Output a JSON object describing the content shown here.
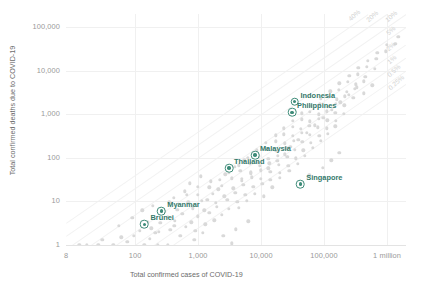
{
  "chart_data": {
    "type": "scatter",
    "title": "",
    "xlabel": "Total confirmed cases of COVID-19",
    "ylabel": "Total confirmed deaths due to COVID-19",
    "xscale": "log",
    "yscale": "log",
    "xlim": [
      8,
      2000000
    ],
    "ylim": [
      1,
      200000
    ],
    "grid": true,
    "legend": "none",
    "x_ticks": [
      {
        "value": 8,
        "label": "8"
      },
      {
        "value": 100,
        "label": "100"
      },
      {
        "value": 1000,
        "label": "1,000"
      },
      {
        "value": 10000,
        "label": "10,000"
      },
      {
        "value": 100000,
        "label": "100,000"
      },
      {
        "value": 1000000,
        "label": "1 million"
      }
    ],
    "y_ticks": [
      {
        "value": 1,
        "label": "1"
      },
      {
        "value": 10,
        "label": "10"
      },
      {
        "value": 100,
        "label": "100"
      },
      {
        "value": 1000,
        "label": "1,000"
      },
      {
        "value": 10000,
        "label": "10,000"
      },
      {
        "value": 100000,
        "label": "100,000"
      }
    ],
    "reference_lines": [
      {
        "label": "40%",
        "ratio": 0.4
      },
      {
        "label": "20%",
        "ratio": 0.2
      },
      {
        "label": "10%",
        "ratio": 0.1
      },
      {
        "label": "5%",
        "ratio": 0.05
      },
      {
        "label": "2%",
        "ratio": 0.02
      },
      {
        "label": "1%",
        "ratio": 0.01
      },
      {
        "label": "0.5%",
        "ratio": 0.005
      },
      {
        "label": "0.25%",
        "ratio": 0.0025
      }
    ],
    "highlighted": [
      {
        "name": "Indonesia",
        "cases": 34000,
        "deaths": 1950,
        "label_dx": 6,
        "label_dy": -7
      },
      {
        "name": "Philippines",
        "cases": 31000,
        "deaths": 1100,
        "label_dx": 5,
        "label_dy": -7
      },
      {
        "name": "Malaysia",
        "cases": 8000,
        "deaths": 115,
        "label_dx": 5,
        "label_dy": -7
      },
      {
        "name": "Thailand",
        "cases": 3100,
        "deaths": 58,
        "label_dx": 5,
        "label_dy": -7
      },
      {
        "name": "Singapore",
        "cases": 42000,
        "deaths": 25,
        "label_dx": 6,
        "label_dy": -7
      },
      {
        "name": "Myanmar",
        "cases": 260,
        "deaths": 6,
        "label_dx": 6,
        "label_dy": -7
      },
      {
        "name": "Brunei",
        "cases": 141,
        "deaths": 3,
        "label_dx": 6,
        "label_dy": -7
      }
    ],
    "background_points": [
      [
        13,
        1
      ],
      [
        17,
        1
      ],
      [
        26,
        1
      ],
      [
        45,
        1
      ],
      [
        140,
        1
      ],
      [
        230,
        1
      ],
      [
        330,
        1
      ],
      [
        30,
        1.3
      ],
      [
        60,
        1.5
      ],
      [
        95,
        1.6
      ],
      [
        210,
        1.9
      ],
      [
        520,
        1.6
      ],
      [
        120,
        2.1
      ],
      [
        180,
        2.4
      ],
      [
        360,
        2.2
      ],
      [
        640,
        2.6
      ],
      [
        900,
        2.1
      ],
      [
        250,
        3.2
      ],
      [
        430,
        3.6
      ],
      [
        780,
        3.3
      ],
      [
        1300,
        3.0
      ],
      [
        1800,
        3.7
      ],
      [
        330,
        4.4
      ],
      [
        560,
        5.2
      ],
      [
        1000,
        4.6
      ],
      [
        1500,
        5.5
      ],
      [
        2400,
        4.9
      ],
      [
        470,
        6.5
      ],
      [
        820,
        7.0
      ],
      [
        1250,
        6.3
      ],
      [
        2000,
        7.5
      ],
      [
        3100,
        6.8
      ],
      [
        4400,
        7.2
      ],
      [
        700,
        9.5
      ],
      [
        1150,
        10.5
      ],
      [
        1900,
        9.2
      ],
      [
        2900,
        11
      ],
      [
        4200,
        9.8
      ],
      [
        6000,
        10.2
      ],
      [
        1000,
        14
      ],
      [
        1700,
        15
      ],
      [
        2600,
        13
      ],
      [
        3900,
        16
      ],
      [
        5600,
        14
      ],
      [
        8000,
        15
      ],
      [
        11000,
        13
      ],
      [
        1500,
        21
      ],
      [
        2400,
        23
      ],
      [
        3600,
        20
      ],
      [
        5200,
        24
      ],
      [
        7500,
        22
      ],
      [
        10500,
        25
      ],
      [
        15000,
        21
      ],
      [
        2200,
        31
      ],
      [
        3400,
        34
      ],
      [
        5000,
        30
      ],
      [
        7200,
        36
      ],
      [
        10000,
        33
      ],
      [
        14000,
        31
      ],
      [
        20000,
        35
      ],
      [
        3100,
        46
      ],
      [
        4700,
        50
      ],
      [
        6800,
        44
      ],
      [
        9800,
        52
      ],
      [
        14000,
        48
      ],
      [
        20000,
        45
      ],
      [
        28000,
        50
      ],
      [
        4400,
        68
      ],
      [
        6600,
        72
      ],
      [
        9500,
        66
      ],
      [
        13500,
        75
      ],
      [
        19000,
        70
      ],
      [
        27000,
        65
      ],
      [
        38000,
        74
      ],
      [
        6200,
        100
      ],
      [
        9200,
        108
      ],
      [
        13000,
        96
      ],
      [
        18500,
        112
      ],
      [
        26000,
        104
      ],
      [
        36000,
        98
      ],
      [
        50000,
        110
      ],
      [
        8600,
        150
      ],
      [
        12500,
        160
      ],
      [
        17500,
        145
      ],
      [
        25000,
        165
      ],
      [
        34000,
        155
      ],
      [
        47000,
        148
      ],
      [
        66000,
        170
      ],
      [
        12000,
        220
      ],
      [
        17000,
        240
      ],
      [
        24000,
        215
      ],
      [
        33000,
        250
      ],
      [
        45000,
        230
      ],
      [
        62000,
        220
      ],
      [
        88000,
        245
      ],
      [
        17000,
        330
      ],
      [
        23000,
        350
      ],
      [
        32000,
        320
      ],
      [
        44000,
        370
      ],
      [
        60000,
        340
      ],
      [
        84000,
        325
      ],
      [
        115000,
        360
      ],
      [
        23000,
        480
      ],
      [
        32000,
        520
      ],
      [
        43000,
        470
      ],
      [
        58000,
        540
      ],
      [
        80000,
        500
      ],
      [
        110000,
        480
      ],
      [
        150000,
        530
      ],
      [
        32000,
        700
      ],
      [
        44000,
        760
      ],
      [
        60000,
        690
      ],
      [
        82000,
        790
      ],
      [
        112000,
        730
      ],
      [
        155000,
        700
      ],
      [
        44000,
        1050
      ],
      [
        60000,
        1130
      ],
      [
        82000,
        1000
      ],
      [
        110000,
        1180
      ],
      [
        150000,
        1080
      ],
      [
        205000,
        1030
      ],
      [
        62000,
        1550
      ],
      [
        85000,
        1680
      ],
      [
        115000,
        1480
      ],
      [
        155000,
        1720
      ],
      [
        210000,
        1600
      ],
      [
        88000,
        2300
      ],
      [
        120000,
        2500
      ],
      [
        160000,
        2200
      ],
      [
        215000,
        2600
      ],
      [
        290000,
        2400
      ],
      [
        125000,
        3400
      ],
      [
        170000,
        3700
      ],
      [
        230000,
        3300
      ],
      [
        310000,
        3850
      ],
      [
        175000,
        5100
      ],
      [
        240000,
        5500
      ],
      [
        320000,
        4900
      ],
      [
        430000,
        5700
      ],
      [
        250000,
        7600
      ],
      [
        340000,
        8200
      ],
      [
        450000,
        7300
      ],
      [
        350000,
        11500
      ],
      [
        480000,
        12200
      ],
      [
        640000,
        11000
      ],
      [
        500000,
        17000
      ],
      [
        680000,
        18500
      ],
      [
        700000,
        26000
      ],
      [
        950000,
        28000
      ],
      [
        1000000,
        39000
      ],
      [
        1350000,
        42000
      ],
      [
        1500000,
        60000
      ],
      [
        75,
        1.2
      ],
      [
        55,
        2.8
      ],
      [
        160,
        3.4
      ],
      [
        90,
        4.2
      ],
      [
        290,
        5.8
      ],
      [
        190,
        8.0
      ],
      [
        410,
        12
      ],
      [
        620,
        17
      ],
      [
        130,
        6.2
      ],
      [
        350,
        9.5
      ],
      [
        740,
        26
      ],
      [
        1100,
        38
      ],
      [
        240,
        2.0
      ],
      [
        420,
        2.8
      ],
      [
        170,
        1.4
      ],
      [
        2700,
        42
      ],
      [
        3800,
        62
      ],
      [
        5400,
        88
      ],
      [
        7600,
        130
      ],
      [
        1600,
        29
      ],
      [
        2100,
        19
      ],
      [
        980,
        22
      ],
      [
        1400,
        11
      ],
      [
        660,
        14
      ],
      [
        4900,
        33
      ],
      [
        6900,
        47
      ],
      [
        9000,
        77
      ],
      [
        13000,
        58
      ],
      [
        18000,
        86
      ],
      [
        24000,
        120
      ],
      [
        430000,
        3000
      ],
      [
        580000,
        4600
      ],
      [
        29000,
        180
      ],
      [
        39000,
        260
      ],
      [
        53000,
        380
      ],
      [
        72000,
        560
      ],
      [
        98000,
        840
      ],
      [
        133000,
        1250
      ],
      [
        180000,
        1900
      ],
      [
        245000,
        2800
      ],
      [
        330000,
        4200
      ],
      [
        95000,
        60
      ],
      [
        130000,
        88
      ],
      [
        175000,
        130
      ],
      [
        58000,
        40
      ],
      [
        2500,
        1.6
      ],
      [
        4000,
        2.3
      ],
      [
        6300,
        3.5
      ],
      [
        1200,
        1.9
      ],
      [
        870,
        1.3
      ],
      [
        3400,
        1.1
      ]
    ]
  }
}
